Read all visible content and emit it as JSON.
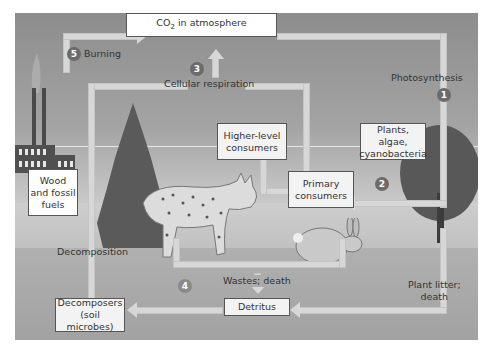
{
  "diagram": {
    "boxes": {
      "atmosphere": "CO2 in atmosphere",
      "atmosphere_main": "CO",
      "atmosphere_sub": "2",
      "atmosphere_rest": " in atmosphere",
      "higher_consumers_line1": "Higher-level",
      "higher_consumers_line2": "consumers",
      "plants_line1": "Plants, algae,",
      "plants_line2": "cyanobacteria",
      "primary_line1": "Primary",
      "primary_line2": "consumers",
      "wood_line1": "Wood",
      "wood_line2": "and fossil",
      "wood_line3": "fuels",
      "decomposers_line1": "Decomposers",
      "decomposers_line2": "(soil microbes)",
      "detritus": "Detritus"
    },
    "labels": {
      "burning": "Burning",
      "cellular_respiration": "Cellular respiration",
      "photosynthesis": "Photosynthesis",
      "decomposition": "Decomposition",
      "wastes_death": "Wastes; death",
      "plant_litter_line1": "Plant litter;",
      "plant_litter_line2": "death"
    },
    "steps": [
      "1",
      "2",
      "3",
      "4",
      "5"
    ],
    "colors": {
      "arrow": "#d7d7d7",
      "step_circle": "#6b6b6b",
      "box_border": "#555555",
      "sky": "#8d8d8d",
      "ground": "#a3a3a3"
    }
  }
}
